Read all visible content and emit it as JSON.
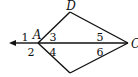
{
  "diagram": {
    "points": [
      {
        "id": "D",
        "label": "D",
        "x": 70,
        "y": 12,
        "lx": 71,
        "ly": 10
      },
      {
        "id": "A",
        "label": "A",
        "x": 38,
        "y": 43,
        "lx": 37,
        "ly": 39
      },
      {
        "id": "C",
        "label": "C",
        "x": 128,
        "y": 43,
        "lx": 131,
        "ly": 48
      },
      {
        "id": "B",
        "label": "",
        "x": 70,
        "y": 73
      }
    ],
    "angles": [
      {
        "id": "1",
        "label": "1",
        "x": 25,
        "y": 41
      },
      {
        "id": "2",
        "label": "2",
        "x": 31,
        "y": 56
      },
      {
        "id": "3",
        "label": "3",
        "x": 52,
        "y": 41
      },
      {
        "id": "4",
        "label": "4",
        "x": 52,
        "y": 56
      },
      {
        "id": "5",
        "label": "5",
        "x": 97,
        "y": 41
      },
      {
        "id": "6",
        "label": "6",
        "x": 97,
        "y": 56
      }
    ],
    "stroke_color": "#111111"
  }
}
